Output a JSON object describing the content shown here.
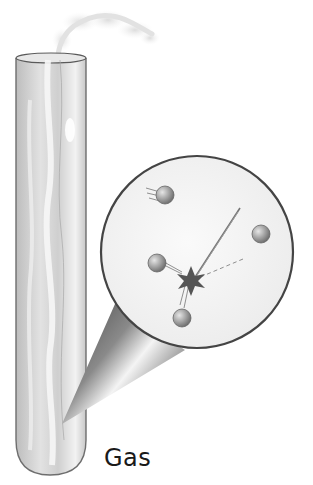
{
  "figure": {
    "label": "Gas",
    "elements": {
      "test_tube": {
        "content": "gas"
      },
      "magnifier": {
        "shape": "circle",
        "molecule_count": 4,
        "collision": true
      },
      "escaping_gas": {
        "location": "top of test tube"
      }
    }
  },
  "colors": {
    "outline": "#3a3a3a",
    "tube_glass": "#cfcfcf",
    "molecule": "#9a9a9a",
    "cone_dark": "#4a4a4a",
    "background": "#ffffff"
  }
}
